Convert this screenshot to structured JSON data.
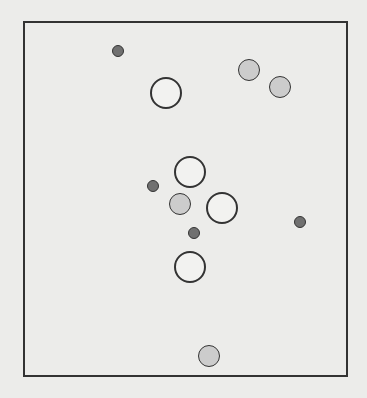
{
  "diagram": {
    "frame": {
      "x": 23,
      "y": 21,
      "width": 325,
      "height": 356
    },
    "circles": [
      {
        "kind": "dark",
        "cx": 118,
        "cy": 51,
        "r": 6
      },
      {
        "kind": "dark",
        "cx": 153,
        "cy": 186,
        "r": 6
      },
      {
        "kind": "dark",
        "cx": 194,
        "cy": 233,
        "r": 6
      },
      {
        "kind": "dark",
        "cx": 300,
        "cy": 222,
        "r": 6
      },
      {
        "kind": "gray",
        "cx": 249,
        "cy": 70,
        "r": 11
      },
      {
        "kind": "gray",
        "cx": 280,
        "cy": 87,
        "r": 11
      },
      {
        "kind": "gray",
        "cx": 180,
        "cy": 204,
        "r": 11
      },
      {
        "kind": "gray",
        "cx": 209,
        "cy": 356,
        "r": 11
      },
      {
        "kind": "white",
        "cx": 166,
        "cy": 93,
        "r": 16
      },
      {
        "kind": "white",
        "cx": 190,
        "cy": 172,
        "r": 16
      },
      {
        "kind": "white",
        "cx": 222,
        "cy": 208,
        "r": 16
      },
      {
        "kind": "white",
        "cx": 190,
        "cy": 267,
        "r": 16
      }
    ],
    "colors": {
      "dark": "#707070",
      "gray": "#cccccc",
      "white": "#f2f2f0",
      "stroke": "#333333"
    }
  }
}
